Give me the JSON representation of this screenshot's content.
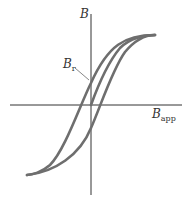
{
  "diagram": {
    "type": "hysteresis-loop",
    "y_axis_label": "B",
    "x_axis_label": {
      "main": "B",
      "sub": "app"
    },
    "remanence_label": {
      "main": "B",
      "sub": "r"
    },
    "colors": {
      "curve": "#6e6e6e",
      "axis": "#333333"
    }
  }
}
